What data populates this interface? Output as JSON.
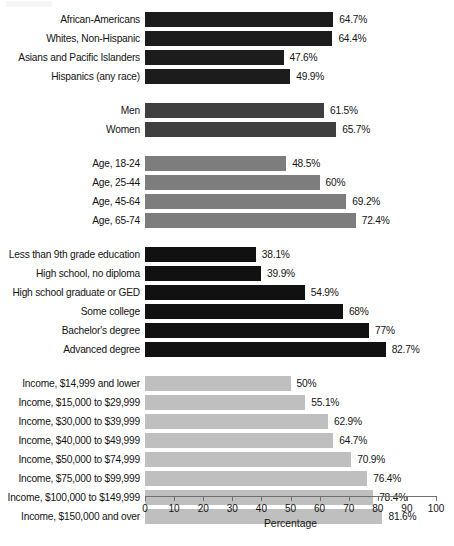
{
  "chart_data": {
    "type": "bar",
    "orientation": "horizontal",
    "title": "",
    "subtitle": "",
    "xlabel": "Percentage",
    "ylabel": "",
    "xlim": [
      0,
      100
    ],
    "xticks": [
      0,
      10,
      20,
      30,
      40,
      50,
      60,
      70,
      80,
      90,
      100
    ],
    "xtick_labels": [
      "0",
      "10",
      "20",
      "30",
      "40",
      "50",
      "60",
      "70",
      "80",
      "90",
      "100"
    ],
    "grid": false,
    "legend": "none",
    "value_label_suffix": "%",
    "categories": [
      "African-Americans",
      "Whites, Non-Hispanic",
      "Asians and Pacific Islanders",
      "Hispanics (any race)",
      "Men",
      "Women",
      "Age, 18-24",
      "Age, 25-44",
      "Age, 45-64",
      "Age, 65-74",
      "Less than 9th grade education",
      "High school, no diploma",
      "High school graduate or GED",
      "Some college",
      "Bachelor's degree",
      "Advanced degree",
      "Income, $14,999 and lower",
      "Income, $15,000 to $29,999",
      "Income, $30,000 to $39,999",
      "Income, $40,000 to $49,999",
      "Income, $50,000 to $74,999",
      "Income, $75,000 to $99,999",
      "Income, $100,000 to $149,999",
      "Income, $150,000 and over"
    ],
    "values": [
      64.7,
      64.4,
      47.6,
      49.9,
      61.5,
      65.7,
      48.5,
      60,
      69.2,
      72.4,
      38.1,
      39.9,
      54.9,
      68,
      77,
      82.7,
      50,
      55.1,
      62.9,
      64.7,
      70.9,
      76.4,
      78.4,
      81.6
    ],
    "value_labels": [
      "64.7%",
      "64.4%",
      "47.6%",
      "49.9%",
      "61.5%",
      "65.7%",
      "48.5%",
      "60%",
      "69.2%",
      "72.4%",
      "38.1%",
      "39.9%",
      "54.9%",
      "68%",
      "77%",
      "82.7%",
      "50%",
      "55.1%",
      "62.9%",
      "64.7%",
      "70.9%",
      "76.4%",
      "78.4%",
      "81.6%"
    ],
    "groups": [
      {
        "name": "Race and ethnicity",
        "color": "#1c1c1c",
        "bars": [
          {
            "label": "African-Americans",
            "value": 64.7,
            "value_label": "64.7%"
          },
          {
            "label": "Whites, Non-Hispanic",
            "value": 64.4,
            "value_label": "64.4%"
          },
          {
            "label": "Asians and Pacific Islanders",
            "value": 47.6,
            "value_label": "47.6%"
          },
          {
            "label": "Hispanics (any race)",
            "value": 49.9,
            "value_label": "49.9%"
          }
        ]
      },
      {
        "name": "Gender",
        "color": "#3f3f3f",
        "bars": [
          {
            "label": "Men",
            "value": 61.5,
            "value_label": "61.5%"
          },
          {
            "label": "Women",
            "value": 65.7,
            "value_label": "65.7%"
          }
        ]
      },
      {
        "name": "Age",
        "color": "#7d7d7d",
        "bars": [
          {
            "label": "Age, 18-24",
            "value": 48.5,
            "value_label": "48.5%"
          },
          {
            "label": "Age, 25-44",
            "value": 60,
            "value_label": "60%"
          },
          {
            "label": "Age, 45-64",
            "value": 69.2,
            "value_label": "69.2%"
          },
          {
            "label": "Age, 65-74",
            "value": 72.4,
            "value_label": "72.4%"
          }
        ]
      },
      {
        "name": "Education",
        "color": "#111111",
        "bars": [
          {
            "label": "Less than 9th grade education",
            "value": 38.1,
            "value_label": "38.1%"
          },
          {
            "label": "High school, no diploma",
            "value": 39.9,
            "value_label": "39.9%"
          },
          {
            "label": "High school graduate or GED",
            "value": 54.9,
            "value_label": "54.9%"
          },
          {
            "label": "Some college",
            "value": 68,
            "value_label": "68%"
          },
          {
            "label": "Bachelor's degree",
            "value": 77,
            "value_label": "77%"
          },
          {
            "label": "Advanced degree",
            "value": 82.7,
            "value_label": "82.7%"
          }
        ]
      },
      {
        "name": "Household income",
        "color": "#bfbfbf",
        "bars": [
          {
            "label": "Income, $14,999 and lower",
            "value": 50,
            "value_label": "50%"
          },
          {
            "label": "Income, $15,000 to $29,999",
            "value": 55.1,
            "value_label": "55.1%"
          },
          {
            "label": "Income, $30,000 to $39,999",
            "value": 62.9,
            "value_label": "62.9%"
          },
          {
            "label": "Income, $40,000 to $49,999",
            "value": 64.7,
            "value_label": "64.7%"
          },
          {
            "label": "Income, $50,000 to $74,999",
            "value": 70.9,
            "value_label": "70.9%"
          },
          {
            "label": "Income, $75,000 to $99,999",
            "value": 76.4,
            "value_label": "76.4%"
          },
          {
            "label": "Income, $100,000 to $149,999",
            "value": 78.4,
            "value_label": "78.4%"
          },
          {
            "label": "Income, $150,000 and over",
            "value": 81.6,
            "value_label": "81.6%"
          }
        ]
      }
    ]
  },
  "axis": {
    "x_title": "Percentage",
    "ticks": [
      "0",
      "10",
      "20",
      "30",
      "40",
      "50",
      "60",
      "70",
      "80",
      "90",
      "100"
    ]
  },
  "colors": {
    "race": "#1c1c1c",
    "gender": "#3f3f3f",
    "age": "#7d7d7d",
    "education": "#111111",
    "income": "#bfbfbf",
    "axis": "#6f6f6f",
    "text": "#141414",
    "background": "#ffffff"
  }
}
